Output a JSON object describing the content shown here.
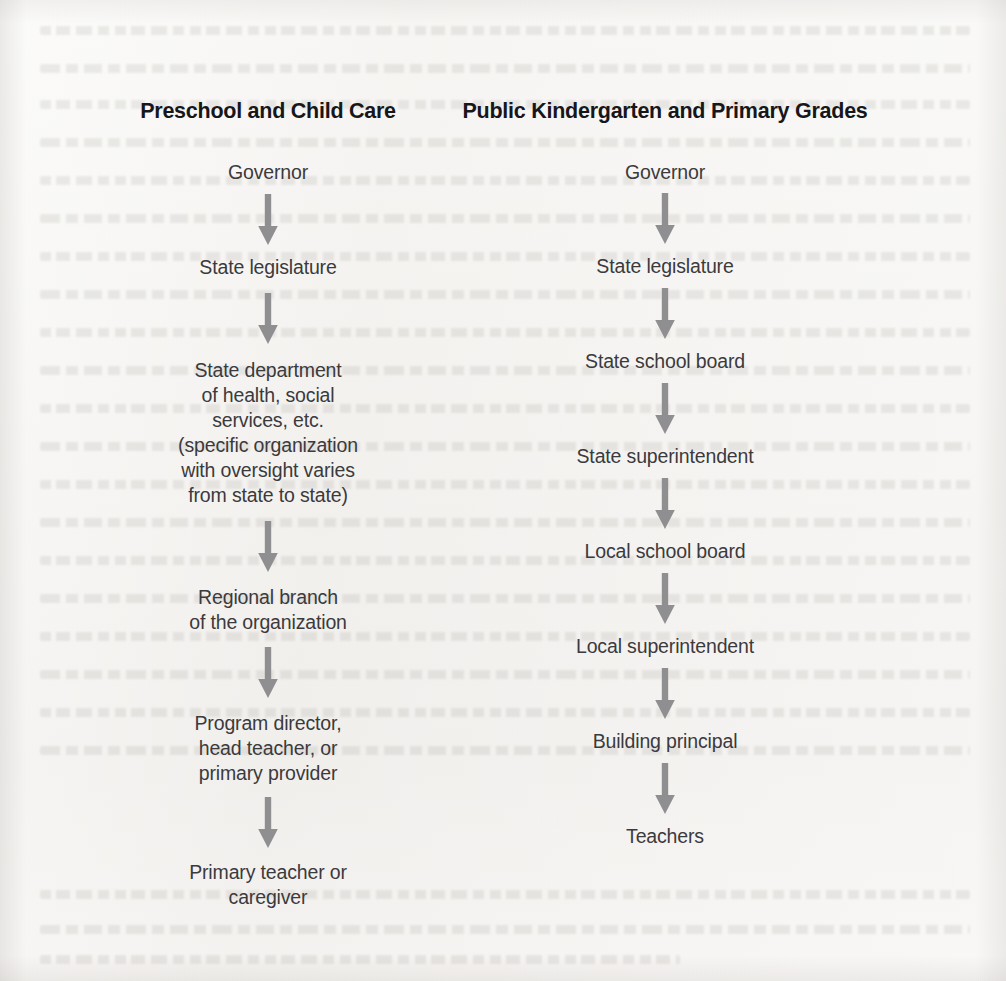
{
  "figure": {
    "type": "flowchart",
    "orientation": "two parallel vertical chains",
    "arrow_color": "#8f8f91",
    "text_color": "#3b3a3d",
    "title_color": "#17161a",
    "background_color": "#f2f0ed"
  },
  "columns": [
    {
      "id": "preschool-child-care",
      "title": "Preschool and Child Care",
      "nodes": [
        "Governor",
        "State legislature",
        "State department\nof health, social\nservices, etc.\n(specific organization\nwith oversight varies\nfrom state to state)",
        "Regional branch\nof the organization",
        "Program director,\nhead teacher, or\nprimary provider",
        "Primary teacher or\ncaregiver"
      ],
      "arrows": [
        {
          "from": "Governor",
          "to": "State legislature"
        },
        {
          "from": "State legislature",
          "to": "State department of health, social services, etc."
        },
        {
          "from": "State department of health, social services, etc.",
          "to": "Regional branch of the organization"
        },
        {
          "from": "Regional branch of the organization",
          "to": "Program director, head teacher, or primary provider"
        },
        {
          "from": "Program director, head teacher, or primary provider",
          "to": "Primary teacher or caregiver"
        }
      ]
    },
    {
      "id": "public-kindergarten-primary-grades",
      "title": "Public Kindergarten and Primary Grades",
      "nodes": [
        "Governor",
        "State legislature",
        "State school board",
        "State superintendent",
        "Local school board",
        "Local superintendent",
        "Building principal",
        "Teachers"
      ],
      "arrows": [
        {
          "from": "Governor",
          "to": "State legislature"
        },
        {
          "from": "State legislature",
          "to": "State school board"
        },
        {
          "from": "State school board",
          "to": "State superintendent"
        },
        {
          "from": "State superintendent",
          "to": "Local school board"
        },
        {
          "from": "Local school board",
          "to": "Local superintendent"
        },
        {
          "from": "Local superintendent",
          "to": "Building principal"
        },
        {
          "from": "Building principal",
          "to": "Teachers"
        }
      ]
    }
  ]
}
